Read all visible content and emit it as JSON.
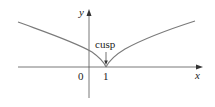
{
  "diagram": {
    "type": "function-graph",
    "axes": {
      "x_label": "x",
      "y_label": "y",
      "tick_labels": [
        "0",
        "1"
      ]
    },
    "annotation": {
      "label": "cusp",
      "points_to": "(1, 0)"
    },
    "curve": {
      "description": "Graph with a cusp at x = 1 on the x-axis, e.g. y = |x - 1|^(2/3)",
      "cusp_point": [
        1,
        0
      ]
    },
    "colors": {
      "curve": "#7a7a7a",
      "axes": "#555555",
      "text": "#222222",
      "background": "#ffffff"
    }
  }
}
